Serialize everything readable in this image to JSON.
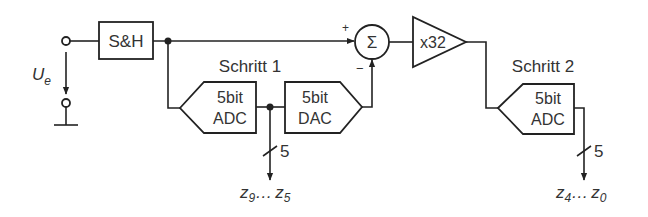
{
  "diagram": {
    "type": "two-step subranging ADC block diagram",
    "input": {
      "label": "U",
      "subscript": "e"
    },
    "blocks": {
      "sample_hold": "S&H",
      "adc1": {
        "line1": "5bit",
        "line2": "ADC"
      },
      "dac": {
        "line1": "5bit",
        "line2": "DAC"
      },
      "summer": {
        "symbol": "Σ",
        "plus": "+",
        "minus": "−"
      },
      "amplifier": "x32",
      "adc2": {
        "line1": "5bit",
        "line2": "ADC"
      }
    },
    "stages": {
      "step1": "Schritt 1",
      "step2": "Schritt 2"
    },
    "outputs": {
      "bus1": {
        "width": "5",
        "label_a": "z",
        "sub_a": "9",
        "dots": "…",
        "label_b": "z",
        "sub_b": "5"
      },
      "bus2": {
        "width": "5",
        "label_a": "z",
        "sub_a": "4",
        "dots": "…",
        "label_b": "z",
        "sub_b": "0"
      }
    }
  }
}
